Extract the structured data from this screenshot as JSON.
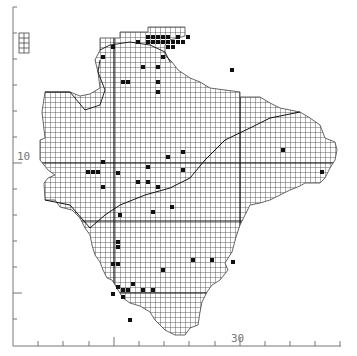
{
  "map": {
    "type": "grid distribution map",
    "grid_cell_px": 5,
    "colors": {
      "grid": "#3a3a3a",
      "axis": "#777777",
      "dot": "#111111",
      "coast": "#222222"
    },
    "axis_labels": {
      "left_major": "10",
      "bottom_major": "30"
    },
    "left_ticks_y": [
      7,
      33,
      59,
      85,
      111,
      137,
      163,
      189,
      215,
      241,
      267,
      293,
      319
    ],
    "left_major_ticks_y": [
      163,
      293
    ],
    "bottom_ticks_x": [
      38,
      63,
      89,
      114,
      139,
      164,
      189,
      215,
      240,
      265,
      290,
      315,
      340
    ],
    "bottom_major_ticks_x": [
      114,
      240
    ],
    "outline": [
      [
        100,
        38
      ],
      [
        120,
        38
      ],
      [
        120,
        32
      ],
      [
        148,
        32
      ],
      [
        148,
        27
      ],
      [
        185,
        27
      ],
      [
        185,
        36
      ],
      [
        170,
        40
      ],
      [
        165,
        45
      ],
      [
        165,
        55
      ],
      [
        172,
        62
      ],
      [
        178,
        70
      ],
      [
        190,
        78
      ],
      [
        200,
        82
      ],
      [
        210,
        88
      ],
      [
        225,
        90
      ],
      [
        240,
        92
      ],
      [
        240,
        97
      ],
      [
        260,
        97
      ],
      [
        270,
        103
      ],
      [
        280,
        108
      ],
      [
        300,
        112
      ],
      [
        310,
        118
      ],
      [
        320,
        125
      ],
      [
        325,
        138
      ],
      [
        335,
        142
      ],
      [
        337,
        150
      ],
      [
        335,
        160
      ],
      [
        330,
        168
      ],
      [
        325,
        178
      ],
      [
        320,
        183
      ],
      [
        305,
        183
      ],
      [
        300,
        186
      ],
      [
        290,
        190
      ],
      [
        280,
        195
      ],
      [
        270,
        200
      ],
      [
        260,
        203
      ],
      [
        250,
        205
      ],
      [
        245,
        215
      ],
      [
        240,
        225
      ],
      [
        236,
        237
      ],
      [
        232,
        252
      ],
      [
        225,
        263
      ],
      [
        228,
        270
      ],
      [
        220,
        280
      ],
      [
        212,
        285
      ],
      [
        207,
        292
      ],
      [
        202,
        302
      ],
      [
        200,
        312
      ],
      [
        198,
        325
      ],
      [
        190,
        328
      ],
      [
        185,
        335
      ],
      [
        175,
        335
      ],
      [
        165,
        330
      ],
      [
        160,
        325
      ],
      [
        155,
        320
      ],
      [
        150,
        312
      ],
      [
        140,
        306
      ],
      [
        130,
        303
      ],
      [
        123,
        298
      ],
      [
        118,
        290
      ],
      [
        112,
        280
      ],
      [
        107,
        278
      ],
      [
        103,
        270
      ],
      [
        100,
        262
      ],
      [
        95,
        255
      ],
      [
        92,
        245
      ],
      [
        90,
        235
      ],
      [
        85,
        228
      ],
      [
        80,
        218
      ],
      [
        72,
        210
      ],
      [
        60,
        207
      ],
      [
        55,
        200
      ],
      [
        45,
        200
      ],
      [
        44,
        183
      ],
      [
        48,
        178
      ],
      [
        55,
        175
      ],
      [
        48,
        170
      ],
      [
        40,
        160
      ],
      [
        40,
        140
      ],
      [
        45,
        138
      ],
      [
        42,
        112
      ],
      [
        45,
        92
      ],
      [
        70,
        92
      ],
      [
        80,
        96
      ],
      [
        90,
        94
      ],
      [
        100,
        88
      ],
      [
        98,
        72
      ],
      [
        95,
        60
      ],
      [
        100,
        50
      ]
    ],
    "island": {
      "x": 19,
      "y": 33,
      "w": 10,
      "h": 20
    },
    "dots": [
      [
        148,
        37
      ],
      [
        153,
        37
      ],
      [
        158,
        37
      ],
      [
        163,
        37
      ],
      [
        168,
        37
      ],
      [
        178,
        37
      ],
      [
        148,
        42
      ],
      [
        153,
        42
      ],
      [
        158,
        42
      ],
      [
        163,
        42
      ],
      [
        168,
        42
      ],
      [
        173,
        42
      ],
      [
        178,
        42
      ],
      [
        188,
        37
      ],
      [
        183,
        42
      ],
      [
        173,
        47
      ],
      [
        168,
        47
      ],
      [
        138,
        42
      ],
      [
        113,
        47
      ],
      [
        103,
        57
      ],
      [
        163,
        57
      ],
      [
        143,
        67
      ],
      [
        158,
        67
      ],
      [
        128,
        82
      ],
      [
        123,
        82
      ],
      [
        158,
        82
      ],
      [
        158,
        92
      ],
      [
        178,
        37
      ],
      [
        232,
        70
      ],
      [
        88,
        172
      ],
      [
        93,
        172
      ],
      [
        98,
        172
      ],
      [
        103,
        162
      ],
      [
        103,
        187
      ],
      [
        118,
        173
      ],
      [
        138,
        182
      ],
      [
        148,
        182
      ],
      [
        148,
        167
      ],
      [
        168,
        157
      ],
      [
        183,
        152
      ],
      [
        183,
        170
      ],
      [
        158,
        187
      ],
      [
        172,
        207
      ],
      [
        153,
        212
      ],
      [
        120,
        215
      ],
      [
        118,
        242
      ],
      [
        118,
        247
      ],
      [
        113,
        264
      ],
      [
        118,
        264
      ],
      [
        118,
        287
      ],
      [
        113,
        294
      ],
      [
        123,
        290
      ],
      [
        128,
        290
      ],
      [
        123,
        297
      ],
      [
        133,
        284
      ],
      [
        143,
        290
      ],
      [
        153,
        290
      ],
      [
        163,
        270
      ],
      [
        193,
        260
      ],
      [
        212,
        260
      ],
      [
        233,
        262
      ],
      [
        283,
        150
      ],
      [
        322,
        172
      ],
      [
        130,
        320
      ]
    ]
  }
}
